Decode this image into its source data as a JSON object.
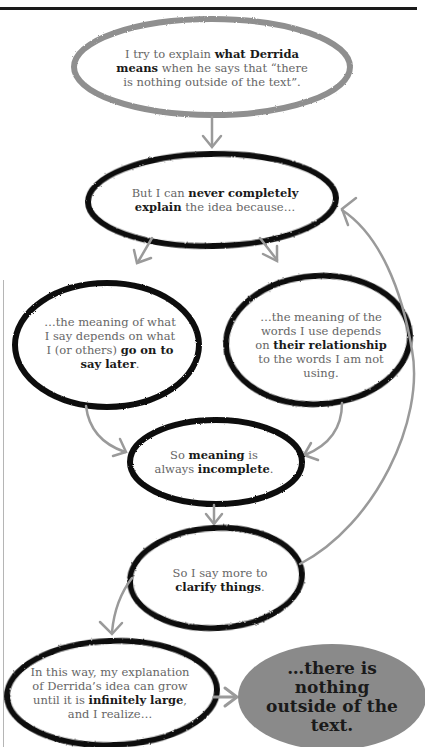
{
  "colors": {
    "stroke_dark": "#111111",
    "stroke_gray": "#8f8f8f",
    "arrow_gray": "#9a9a9a",
    "final_fill": "#8a8a8a",
    "text_gray": "#666666",
    "text_bold": "#1a1a1a"
  },
  "nodes": [
    {
      "id": "start",
      "parts": [
        {
          "t": "I try to explain ",
          "b": false
        },
        {
          "t": "what Derrida means",
          "b": true
        },
        {
          "t": " when he says that “there is nothing outside of the text”.",
          "b": false
        }
      ]
    },
    {
      "id": "never-explain",
      "parts": [
        {
          "t": "But I can ",
          "b": false
        },
        {
          "t": "never completely explain",
          "b": true
        },
        {
          "t": " the idea because…",
          "b": false
        }
      ]
    },
    {
      "id": "say-later",
      "parts": [
        {
          "t": "…the meaning of what I say depends on what I (or others) ",
          "b": false
        },
        {
          "t": "go on to say later",
          "b": true
        },
        {
          "t": ".",
          "b": false
        }
      ]
    },
    {
      "id": "relationship",
      "parts": [
        {
          "t": "…the meaning of the words I use depends on ",
          "b": false
        },
        {
          "t": "their relationship",
          "b": true
        },
        {
          "t": " to the words I am not using.",
          "b": false
        }
      ]
    },
    {
      "id": "incomplete",
      "parts": [
        {
          "t": "So ",
          "b": false
        },
        {
          "t": "meaning",
          "b": true
        },
        {
          "t": " is always ",
          "b": false
        },
        {
          "t": "incomplete",
          "b": true
        },
        {
          "t": ".",
          "b": false
        }
      ]
    },
    {
      "id": "clarify",
      "parts": [
        {
          "t": "So I say more to ",
          "b": false
        },
        {
          "t": "clarify things",
          "b": true
        },
        {
          "t": ".",
          "b": false
        }
      ]
    },
    {
      "id": "infinite",
      "parts": [
        {
          "t": "In this way, my explanation of Derrida’s idea can grow until it is ",
          "b": false
        },
        {
          "t": "infinitely large",
          "b": true
        },
        {
          "t": ", and I realize…",
          "b": false
        }
      ]
    },
    {
      "id": "conclusion",
      "parts": [
        {
          "t": "…there is nothing outside of the text.",
          "b": true
        }
      ]
    }
  ],
  "edges": [
    {
      "from": "start",
      "to": "never-explain"
    },
    {
      "from": "never-explain",
      "to": "say-later"
    },
    {
      "from": "never-explain",
      "to": "relationship"
    },
    {
      "from": "say-later",
      "to": "incomplete"
    },
    {
      "from": "relationship",
      "to": "incomplete"
    },
    {
      "from": "incomplete",
      "to": "clarify"
    },
    {
      "from": "clarify",
      "to": "never-explain",
      "label": "loop back"
    },
    {
      "from": "clarify",
      "to": "infinite"
    },
    {
      "from": "infinite",
      "to": "conclusion"
    }
  ]
}
